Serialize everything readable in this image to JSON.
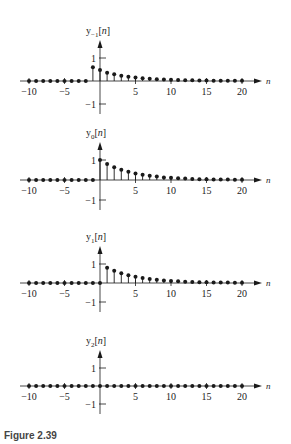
{
  "caption": "Figure 2.39",
  "chart_data": [
    {
      "type": "stem",
      "title": "",
      "ylabel": "y_{-1}[n]",
      "ylabel_main": "y",
      "ylabel_sub": "−1",
      "xlabel": "n",
      "xlim": [
        -10,
        20
      ],
      "ylim": [
        -1,
        1
      ],
      "xticks": [
        -10,
        -5,
        5,
        10,
        15,
        20
      ],
      "yticks": [
        1,
        -1
      ],
      "n": [
        -10,
        -9,
        -8,
        -7,
        -6,
        -5,
        -4,
        -3,
        -2,
        -1,
        0,
        1,
        2,
        3,
        4,
        5,
        6,
        7,
        8,
        9,
        10,
        11,
        12,
        13,
        14,
        15,
        16,
        17,
        18,
        19,
        20
      ],
      "values": [
        0,
        0,
        0,
        0,
        0,
        0,
        0,
        0,
        0,
        0.6,
        0.48,
        0.36,
        0.29,
        0.23,
        0.19,
        0.15,
        0.12,
        0.1,
        0.08,
        0.06,
        0.05,
        0.04,
        0.03,
        0.03,
        0.02,
        0.02,
        0.01,
        0.01,
        0.01,
        0.01,
        0.01
      ]
    },
    {
      "type": "stem",
      "ylabel": "y_0[n]",
      "ylabel_main": "y",
      "ylabel_sub": "0",
      "xlabel": "n",
      "xlim": [
        -10,
        20
      ],
      "ylim": [
        -1,
        1
      ],
      "xticks": [
        -10,
        -5,
        5,
        10,
        15,
        20
      ],
      "yticks": [
        1,
        -1
      ],
      "n": [
        -10,
        -9,
        -8,
        -7,
        -6,
        -5,
        -4,
        -3,
        -2,
        -1,
        0,
        1,
        2,
        3,
        4,
        5,
        6,
        7,
        8,
        9,
        10,
        11,
        12,
        13,
        14,
        15,
        16,
        17,
        18,
        19,
        20
      ],
      "values": [
        0,
        0,
        0,
        0,
        0,
        0,
        0,
        0,
        0,
        0,
        1,
        0.8,
        0.64,
        0.51,
        0.41,
        0.33,
        0.26,
        0.21,
        0.17,
        0.13,
        0.11,
        0.09,
        0.07,
        0.05,
        0.04,
        0.04,
        0.03,
        0.02,
        0.02,
        0.01,
        0.01
      ]
    },
    {
      "type": "stem",
      "ylabel": "y_1[n]",
      "ylabel_main": "y",
      "ylabel_sub": "1",
      "xlabel": "n",
      "xlim": [
        -10,
        20
      ],
      "ylim": [
        -1,
        1
      ],
      "xticks": [
        -10,
        -5,
        5,
        10,
        15,
        20
      ],
      "yticks": [
        1,
        -1
      ],
      "n": [
        -10,
        -9,
        -8,
        -7,
        -6,
        -5,
        -4,
        -3,
        -2,
        -1,
        0,
        1,
        2,
        3,
        4,
        5,
        6,
        7,
        8,
        9,
        10,
        11,
        12,
        13,
        14,
        15,
        16,
        17,
        18,
        19,
        20
      ],
      "values": [
        0,
        0,
        0,
        0,
        0,
        0,
        0,
        0,
        0,
        0,
        0,
        0.8,
        0.64,
        0.51,
        0.41,
        0.33,
        0.26,
        0.21,
        0.17,
        0.13,
        0.11,
        0.09,
        0.07,
        0.05,
        0.04,
        0.04,
        0.03,
        0.02,
        0.02,
        0.01,
        0.01
      ]
    },
    {
      "type": "stem",
      "ylabel": "y_2[n]",
      "ylabel_main": "y",
      "ylabel_sub": "2",
      "xlabel": "n",
      "xlim": [
        -10,
        20
      ],
      "ylim": [
        -1,
        1
      ],
      "xticks": [
        -10,
        -5,
        5,
        10,
        15,
        20
      ],
      "yticks": [
        1,
        -1
      ],
      "n": [
        -10,
        -9,
        -8,
        -7,
        -6,
        -5,
        -4,
        -3,
        -2,
        -1,
        0,
        1,
        2,
        3,
        4,
        5,
        6,
        7,
        8,
        9,
        10,
        11,
        12,
        13,
        14,
        15,
        16,
        17,
        18,
        19,
        20
      ],
      "values": [
        0,
        0,
        0,
        0,
        0,
        0,
        0,
        0,
        0,
        0,
        0,
        0,
        0,
        0,
        0,
        0,
        0,
        0,
        0,
        0,
        0,
        0,
        0,
        0,
        0,
        0,
        0,
        0,
        0,
        0,
        0
      ]
    }
  ]
}
